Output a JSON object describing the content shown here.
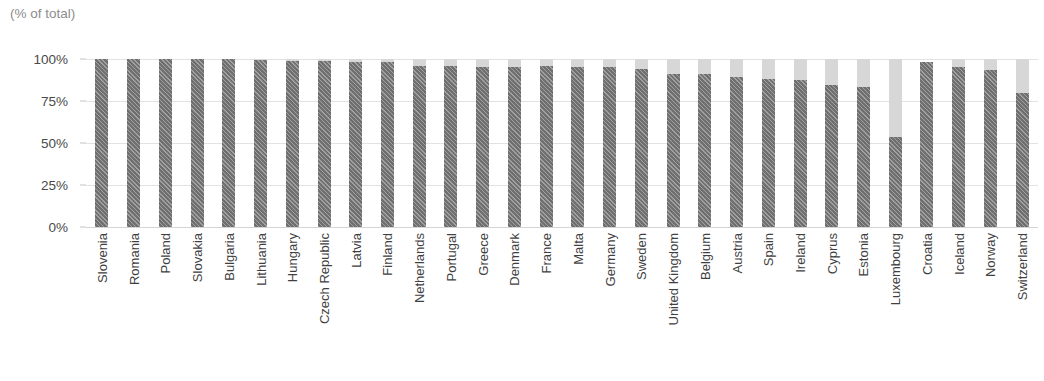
{
  "chart_data": {
    "type": "bar",
    "subtype": "stacked-bar",
    "title": "",
    "subtitle": "(% of total)",
    "xlabel": "",
    "ylabel": "",
    "ylim": [
      0,
      100
    ],
    "ytick_labels": [
      "100%",
      "75%",
      "50%",
      "25%",
      "0%"
    ],
    "ytick_values": [
      100,
      75,
      50,
      25,
      0
    ],
    "grid": true,
    "legend": "none",
    "colors": {
      "series_dark": "#6f6f6f",
      "series_light": "#d7d7d7",
      "gridline": "#e2e2e2",
      "axis_text": "#4a4a4a",
      "subtitle_text": "#8d8d8d"
    },
    "categories": [
      "Slovenia",
      "Romania",
      "Poland",
      "Slovakia",
      "Bulgaria",
      "Lithuania",
      "Hungary",
      "Czech Republic",
      "Latvia",
      "Finland",
      "Netherlands",
      "Portugal",
      "Greece",
      "Denmark",
      "France",
      "Malta",
      "Germany",
      "Sweden",
      "United Kingdom",
      "Belgium",
      "Austria",
      "Spain",
      "Ireland",
      "Cyprus",
      "Estonia",
      "Luxembourg",
      "Croatia",
      "Iceland",
      "Norway",
      "Switzerland"
    ],
    "series": [
      {
        "name": "dark-hatched",
        "values": [
          100,
          100,
          100,
          100,
          100,
          99.5,
          99,
          99,
          98.5,
          98.5,
          96,
          96,
          95.5,
          95,
          96,
          95.5,
          95,
          94,
          91,
          91,
          89.5,
          88,
          87.5,
          84.5,
          83.5,
          53.5,
          98,
          95,
          93.5,
          79.5
        ]
      },
      {
        "name": "light-grey",
        "values": [
          0,
          0,
          0,
          0,
          0,
          0.5,
          1,
          1,
          1.5,
          1.5,
          4,
          4,
          4.5,
          5,
          4,
          4.5,
          5,
          6,
          9,
          9,
          10.5,
          12,
          12.5,
          15.5,
          16.5,
          46.5,
          0,
          5,
          6.5,
          20.5
        ]
      }
    ]
  }
}
